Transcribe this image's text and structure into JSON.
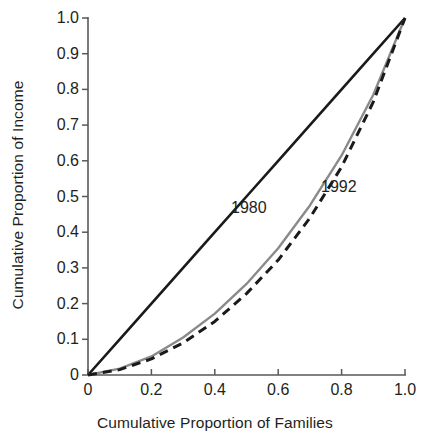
{
  "chart_data": {
    "type": "line",
    "title": "",
    "subtitle": "",
    "xlabel": "Cumulative Proportion of Families",
    "ylabel": "Cumulative Proportion of Income",
    "xlim": [
      0,
      1.0
    ],
    "ylim": [
      0,
      1.0
    ],
    "grid": false,
    "legend_position": "inline-annotations",
    "x_ticks": [
      "0",
      "0.2",
      "0.4",
      "0.6",
      "0.8",
      "1.0"
    ],
    "x_tick_values": [
      0,
      0.2,
      0.4,
      0.6,
      0.8,
      1.0
    ],
    "y_ticks": [
      "0",
      "0.1",
      "0.2",
      "0.3",
      "0.4",
      "0.5",
      "0.6",
      "0.7",
      "0.8",
      "0.9",
      "1.0"
    ],
    "y_tick_values": [
      0,
      0.1,
      0.2,
      0.3,
      0.4,
      0.5,
      0.6,
      0.7,
      0.8,
      0.9,
      1.0
    ],
    "x": [
      0,
      0.1,
      0.2,
      0.3,
      0.4,
      0.5,
      0.6,
      0.7,
      0.8,
      0.9,
      1.0
    ],
    "series": [
      {
        "name": "line-of-equality",
        "label": "",
        "style": "solid",
        "color": "#1a1a1a",
        "width": 2.6,
        "values": [
          0,
          0.1,
          0.2,
          0.3,
          0.4,
          0.5,
          0.6,
          0.7,
          0.8,
          0.9,
          1.0
        ]
      },
      {
        "name": "1980",
        "label": "1980",
        "style": "solid",
        "color": "#8a8a8a",
        "width": 2.4,
        "values": [
          0,
          0.018,
          0.052,
          0.105,
          0.172,
          0.255,
          0.355,
          0.475,
          0.615,
          0.785,
          1.0
        ]
      },
      {
        "name": "1992",
        "label": "1992",
        "style": "dashed",
        "color": "#1a1a1a",
        "width": 3.0,
        "values": [
          0,
          0.015,
          0.045,
          0.09,
          0.15,
          0.228,
          0.322,
          0.44,
          0.583,
          0.765,
          1.0
        ]
      }
    ],
    "annotations": [
      {
        "text": "1980",
        "x": 0.5,
        "y": 0.44
      },
      {
        "text": "1992",
        "x": 0.78,
        "y": 0.5
      }
    ],
    "axis_color": "#58595b",
    "text_color": "#231f20"
  }
}
